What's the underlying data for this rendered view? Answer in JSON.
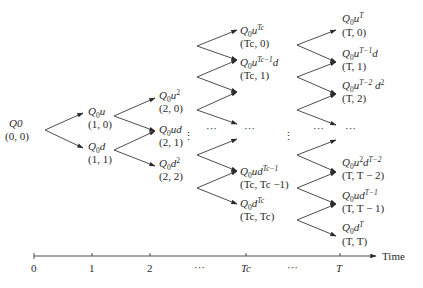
{
  "diagram": {
    "root": {
      "value": "Q0",
      "coord": "(0, 0)"
    },
    "levels": [
      {
        "step": "1",
        "nodes": [
          {
            "base": "Q",
            "sub": "0",
            "tail": "u",
            "sup": "",
            "tail2": "",
            "sup2": "",
            "coord": "(1, 0)"
          },
          {
            "base": "Q",
            "sub": "0",
            "tail": "d",
            "sup": "",
            "tail2": "",
            "sup2": "",
            "coord": "(1, 1)"
          }
        ]
      },
      {
        "step": "2",
        "nodes": [
          {
            "base": "Q",
            "sub": "0",
            "tail": "u",
            "sup": "2",
            "tail2": "",
            "sup2": "",
            "coord": "(2, 0)"
          },
          {
            "base": "Q",
            "sub": "0",
            "tail": "ud",
            "sup": "",
            "tail2": "",
            "sup2": "",
            "coord": "(2, 1)"
          },
          {
            "base": "Q",
            "sub": "0",
            "tail": "d",
            "sup": "2",
            "tail2": "",
            "sup2": "",
            "coord": "(2, 2)"
          }
        ]
      },
      {
        "step": "Tc",
        "nodes": [
          {
            "base": "Q",
            "sub": "0",
            "tail": "u",
            "sup": "Tc",
            "tail2": "",
            "sup2": "",
            "coord": "(Tc, 0)"
          },
          {
            "base": "Q",
            "sub": "0",
            "tail": "u",
            "sup": "Tc−1",
            "tail2": "d",
            "sup2": "",
            "coord": "(Tc, 1)"
          },
          {
            "base": "Q",
            "sub": "0",
            "tail": "ud",
            "sup": "Tc−1",
            "tail2": "",
            "sup2": "",
            "coord": "(Tc, Tc −1)"
          },
          {
            "base": "Q",
            "sub": "0",
            "tail": "d",
            "sup": "Tc",
            "tail2": "",
            "sup2": "",
            "coord": "(Tc, Tc)"
          }
        ]
      },
      {
        "step": "T",
        "nodes": [
          {
            "base": "Q",
            "sub": "0",
            "tail": "u",
            "sup": "T",
            "tail2": "",
            "sup2": "",
            "coord": "(T, 0)"
          },
          {
            "base": "Q",
            "sub": "0",
            "tail": "u",
            "sup": "T−1",
            "tail2": "d",
            "sup2": "",
            "coord": "(T, 1)"
          },
          {
            "base": "Q",
            "sub": "0",
            "tail": "u",
            "sup": "T−2",
            "tail2": " d",
            "sup2": "2",
            "coord": "(T, 2)"
          },
          {
            "base": "Q",
            "sub": "0",
            "tail": "u",
            "sup": "2",
            "tail2": "d",
            "sup2": "T−2",
            "coord": "(T, T − 2)"
          },
          {
            "base": "Q",
            "sub": "0",
            "tail": "ud",
            "sup": "T−1",
            "tail2": "",
            "sup2": "",
            "coord": "(T, T − 1)"
          },
          {
            "base": "Q",
            "sub": "0",
            "tail": "d",
            "sup": "T",
            "tail2": "",
            "sup2": "",
            "coord": "(T, T)"
          }
        ]
      }
    ],
    "ellipsis": "···",
    "vdots": "⋮",
    "axis": {
      "label": "Time",
      "ticks": [
        "0",
        "1",
        "2",
        "···",
        "Tc",
        "···",
        "T"
      ]
    }
  }
}
